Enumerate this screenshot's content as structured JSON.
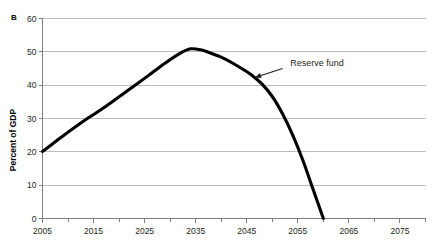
{
  "panel": {
    "label": "B"
  },
  "chart_data": {
    "type": "line",
    "title": "",
    "panel_label": "B",
    "xlabel": "",
    "ylabel": "Percent of GDP",
    "xlim": [
      2005,
      2080
    ],
    "ylim": [
      0,
      60
    ],
    "grid": true,
    "legend": "none",
    "x_tick_labels": [
      "2005",
      "2015",
      "2025",
      "2035",
      "2045",
      "2055",
      "2065",
      "2075"
    ],
    "x_tick_values": [
      2005,
      2015,
      2025,
      2035,
      2045,
      2055,
      2065,
      2075
    ],
    "x_minor_tick_values": [
      2010,
      2020,
      2030,
      2040,
      2050,
      2060,
      2070,
      2080
    ],
    "y_tick_labels": [
      "0",
      "10",
      "20",
      "30",
      "40",
      "50",
      "60"
    ],
    "y_tick_values": [
      0,
      10,
      20,
      30,
      40,
      50,
      60
    ],
    "series": [
      {
        "name": "Reserve fund",
        "color": "#000000",
        "x": [
          2005,
          2008,
          2011,
          2014,
          2017,
          2020,
          2023,
          2026,
          2029,
          2032,
          2034,
          2036,
          2038,
          2040,
          2042,
          2044,
          2046,
          2048,
          2050,
          2052,
          2054,
          2056,
          2058,
          2060
        ],
        "values": [
          20.1,
          23.6,
          27.0,
          30.2,
          33.2,
          36.5,
          39.8,
          43.2,
          46.6,
          49.6,
          50.9,
          50.6,
          49.6,
          48.4,
          46.8,
          45.0,
          43.0,
          40.3,
          36.6,
          31.4,
          25.0,
          17.4,
          8.7,
          0.0
        ]
      }
    ],
    "annotations": [
      {
        "text": "Reserve fund",
        "text_x": 2053.5,
        "text_y": 45.8,
        "arrow_from_x": 2052.0,
        "arrow_from_y": 45.0,
        "arrow_to_x": 2046.6,
        "arrow_to_y": 42.3
      }
    ]
  }
}
